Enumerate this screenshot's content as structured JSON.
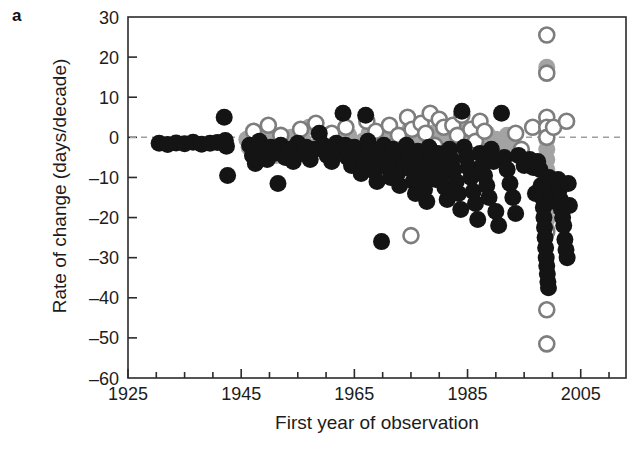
{
  "panel": {
    "label": "a"
  },
  "chart_data": {
    "type": "scatter",
    "title": "",
    "xlabel": "First year of observation",
    "ylabel": "Rate of change (days/decade)",
    "xlim": [
      1925,
      2013
    ],
    "ylim": [
      -60,
      30
    ],
    "xticks_major": [
      1925,
      1945,
      1965,
      1985,
      2005
    ],
    "xtick_labels": [
      "1925",
      "1945",
      "1965",
      "1985",
      "2005"
    ],
    "xticks_minor_step": 5,
    "yticks": [
      30,
      20,
      10,
      0,
      -10,
      -20,
      -30,
      -40,
      -50,
      -60
    ],
    "ytick_labels": [
      "30",
      "20",
      "10",
      "0",
      "-10",
      "-20",
      "-30",
      "-40",
      "-50",
      "-60"
    ],
    "grid": false,
    "legend": "none",
    "reference_line": {
      "y": 0,
      "style": "dashed",
      "color": "#9a9a9a"
    },
    "marker_radius_px": 8.5,
    "colors": {
      "filled_black": "#141414",
      "filled_gray": "#a3a3a3",
      "open_outline": "#7d7d7d",
      "open_fill": "#ffffff",
      "axis": "#2b2b2b",
      "zero_line": "#9e9e9e"
    },
    "series": [
      {
        "name": "filled-black",
        "marker": "filled-circle",
        "color": "#141414",
        "points": [
          [
            1930.5,
            -1.5
          ],
          [
            1932.0,
            -1.8
          ],
          [
            1933.5,
            -1.4
          ],
          [
            1935.0,
            -1.6
          ],
          [
            1936.5,
            -1.2
          ],
          [
            1938.0,
            -1.7
          ],
          [
            1939.5,
            -1.5
          ],
          [
            1940.8,
            -1.3
          ],
          [
            1942.0,
            5.0
          ],
          [
            1942.2,
            -0.8
          ],
          [
            1942.4,
            -2.2
          ],
          [
            1942.6,
            -9.5
          ],
          [
            1946.5,
            -2.0
          ],
          [
            1947.0,
            -4.5
          ],
          [
            1947.5,
            -6.5
          ],
          [
            1948.2,
            -1.0
          ],
          [
            1949.0,
            -3.5
          ],
          [
            1949.6,
            -5.5
          ],
          [
            1950.2,
            -2.5
          ],
          [
            1950.8,
            -4.0
          ],
          [
            1951.5,
            -11.5
          ],
          [
            1952.0,
            -2.0
          ],
          [
            1952.8,
            -5.0
          ],
          [
            1953.5,
            -3.0
          ],
          [
            1954.2,
            -6.0
          ],
          [
            1955.0,
            -1.5
          ],
          [
            1955.8,
            -4.0
          ],
          [
            1956.5,
            -2.5
          ],
          [
            1957.2,
            -5.5
          ],
          [
            1958.0,
            -3.0
          ],
          [
            1958.8,
            1.0
          ],
          [
            1959.5,
            -2.0
          ],
          [
            1960.2,
            -4.5
          ],
          [
            1961.0,
            -6.0
          ],
          [
            1961.8,
            -1.5
          ],
          [
            1962.5,
            -3.5
          ],
          [
            1963.0,
            6.0
          ],
          [
            1963.4,
            -2.0
          ],
          [
            1963.8,
            -5.0
          ],
          [
            1964.5,
            -7.0
          ],
          [
            1965.0,
            -2.5
          ],
          [
            1965.6,
            -4.0
          ],
          [
            1966.2,
            -9.0
          ],
          [
            1966.8,
            -6.5
          ],
          [
            1967.0,
            5.5
          ],
          [
            1967.4,
            -1.0
          ],
          [
            1967.8,
            -3.5
          ],
          [
            1968.2,
            -6.0
          ],
          [
            1968.6,
            -8.5
          ],
          [
            1969.0,
            -11.0
          ],
          [
            1969.4,
            -4.0
          ],
          [
            1969.8,
            -26.0
          ],
          [
            1970.2,
            -2.0
          ],
          [
            1970.6,
            -5.5
          ],
          [
            1971.0,
            -7.5
          ],
          [
            1971.4,
            -10.0
          ],
          [
            1971.8,
            -3.0
          ],
          [
            1972.2,
            -6.5
          ],
          [
            1972.6,
            -9.0
          ],
          [
            1973.0,
            -12.0
          ],
          [
            1973.4,
            -4.5
          ],
          [
            1973.8,
            -7.0
          ],
          [
            1974.2,
            -2.0
          ],
          [
            1974.6,
            -5.0
          ],
          [
            1975.0,
            -8.0
          ],
          [
            1975.4,
            -11.0
          ],
          [
            1975.8,
            -14.0
          ],
          [
            1976.2,
            -3.5
          ],
          [
            1976.6,
            -6.0
          ],
          [
            1977.0,
            -9.5
          ],
          [
            1977.4,
            -13.0
          ],
          [
            1977.8,
            -16.0
          ],
          [
            1978.2,
            -2.5
          ],
          [
            1978.6,
            -5.0
          ],
          [
            1979.0,
            -7.5
          ],
          [
            1979.4,
            -10.5
          ],
          [
            1979.8,
            -4.0
          ],
          [
            1980.2,
            -6.5
          ],
          [
            1980.6,
            -9.0
          ],
          [
            1981.0,
            -12.5
          ],
          [
            1981.4,
            -15.5
          ],
          [
            1981.8,
            -3.0
          ],
          [
            1982.2,
            -5.5
          ],
          [
            1982.6,
            -8.0
          ],
          [
            1983.0,
            -11.0
          ],
          [
            1983.4,
            -14.0
          ],
          [
            1983.8,
            -18.0
          ],
          [
            1984.0,
            6.5
          ],
          [
            1984.4,
            -2.5
          ],
          [
            1984.8,
            -5.0
          ],
          [
            1985.2,
            -7.5
          ],
          [
            1985.6,
            -10.0
          ],
          [
            1986.0,
            -13.5
          ],
          [
            1986.4,
            -16.5
          ],
          [
            1986.8,
            -20.5
          ],
          [
            1987.2,
            -4.0
          ],
          [
            1987.6,
            -7.0
          ],
          [
            1988.0,
            -9.5
          ],
          [
            1988.4,
            -12.0
          ],
          [
            1988.8,
            -15.0
          ],
          [
            1989.2,
            -3.0
          ],
          [
            1989.6,
            -6.0
          ],
          [
            1990.0,
            -18.5
          ],
          [
            1990.5,
            -22.0
          ],
          [
            1991.0,
            6.0
          ],
          [
            1991.5,
            -5.0
          ],
          [
            1992.0,
            -8.0
          ],
          [
            1992.5,
            -11.5
          ],
          [
            1993.0,
            -15.0
          ],
          [
            1993.5,
            -19.0
          ],
          [
            1994.0,
            -4.5
          ],
          [
            1995.0,
            -7.0
          ],
          [
            1996.0,
            -5.5
          ],
          [
            1996.6,
            -7.5
          ],
          [
            1997.0,
            -14.0
          ],
          [
            1997.4,
            -6.0
          ],
          [
            1997.8,
            -8.0
          ],
          [
            1998.0,
            -12.0
          ],
          [
            1998.2,
            -15.0
          ],
          [
            1998.4,
            -17.5
          ],
          [
            1998.5,
            -20.0
          ],
          [
            1998.6,
            -22.5
          ],
          [
            1998.7,
            -25.0
          ],
          [
            1998.8,
            -27.5
          ],
          [
            1998.9,
            -30.0
          ],
          [
            1999.0,
            -32.0
          ],
          [
            1999.1,
            -34.0
          ],
          [
            1999.2,
            -36.0
          ],
          [
            1999.3,
            -37.5
          ],
          [
            1999.4,
            -10.0
          ],
          [
            1999.5,
            -13.0
          ],
          [
            1999.6,
            -16.0
          ],
          [
            2001.0,
            -10.5
          ],
          [
            2001.2,
            -13.0
          ],
          [
            2001.4,
            -15.5
          ],
          [
            2001.6,
            -18.0
          ],
          [
            2001.8,
            -20.0
          ],
          [
            2002.0,
            -22.0
          ],
          [
            2002.2,
            -25.5
          ],
          [
            2002.4,
            -28.0
          ],
          [
            2002.6,
            -30.0
          ],
          [
            2002.8,
            -11.5
          ],
          [
            2003.0,
            -17.0
          ]
        ]
      },
      {
        "name": "filled-gray",
        "marker": "filled-circle",
        "color": "#a3a3a3",
        "points": [
          [
            1946.0,
            -0.5
          ],
          [
            1946.4,
            -2.5
          ],
          [
            1948.5,
            -1.0
          ],
          [
            1949.2,
            -3.0
          ],
          [
            1950.0,
            0.5
          ],
          [
            1950.6,
            -2.0
          ],
          [
            1951.2,
            -4.5
          ],
          [
            1952.5,
            -1.5
          ],
          [
            1953.8,
            0.0
          ],
          [
            1954.8,
            -3.5
          ],
          [
            1956.0,
            -1.0
          ],
          [
            1957.0,
            2.5
          ],
          [
            1958.5,
            -2.0
          ],
          [
            1960.0,
            -0.5
          ],
          [
            1961.4,
            -3.0
          ],
          [
            1962.8,
            -1.5
          ],
          [
            1964.0,
            0.5
          ],
          [
            1965.4,
            -2.5
          ],
          [
            1966.5,
            -1.0
          ],
          [
            1967.6,
            1.0
          ],
          [
            1968.4,
            -3.5
          ],
          [
            1969.2,
            -0.5
          ],
          [
            1970.0,
            -2.0
          ],
          [
            1970.8,
            1.5
          ],
          [
            1971.6,
            -1.5
          ],
          [
            1972.4,
            0.0
          ],
          [
            1973.2,
            -3.0
          ],
          [
            1974.0,
            -1.0
          ],
          [
            1974.8,
            2.0
          ],
          [
            1975.6,
            -2.5
          ],
          [
            1976.4,
            0.5
          ],
          [
            1977.2,
            -1.5
          ],
          [
            1978.0,
            -4.0
          ],
          [
            1978.8,
            1.0
          ],
          [
            1979.6,
            -0.5
          ],
          [
            1980.4,
            -2.5
          ],
          [
            1981.2,
            0.5
          ],
          [
            1982.0,
            -1.5
          ],
          [
            1982.8,
            -3.5
          ],
          [
            1983.6,
            1.5
          ],
          [
            1984.4,
            -0.5
          ],
          [
            1985.2,
            -2.0
          ],
          [
            1986.0,
            0.0
          ],
          [
            1986.8,
            -3.0
          ],
          [
            1987.6,
            -1.0
          ],
          [
            1988.4,
            1.0
          ],
          [
            1989.2,
            -2.0
          ],
          [
            1990.0,
            -0.5
          ],
          [
            1991.0,
            -2.5
          ],
          [
            1992.0,
            0.5
          ],
          [
            1993.0,
            -1.5
          ],
          [
            1999.0,
            16.5
          ],
          [
            1999.0,
            17.5
          ],
          [
            1999.0,
            1.5
          ],
          [
            1999.0,
            -0.5
          ],
          [
            1999.0,
            -3.0
          ],
          [
            1999.0,
            -5.5
          ],
          [
            1999.0,
            -8.0
          ],
          [
            1999.0,
            -10.5
          ],
          [
            1999.0,
            -13.0
          ],
          [
            1999.0,
            -15.5
          ],
          [
            1999.0,
            -18.0
          ],
          [
            1999.0,
            -20.5
          ],
          [
            1999.0,
            -23.0
          ]
        ]
      },
      {
        "name": "open-circle",
        "marker": "open-circle",
        "color": "#7d7d7d",
        "points": [
          [
            1947.2,
            1.5
          ],
          [
            1949.8,
            3.0
          ],
          [
            1952.0,
            0.5
          ],
          [
            1955.5,
            2.0
          ],
          [
            1958.2,
            3.5
          ],
          [
            1961.0,
            1.0
          ],
          [
            1963.5,
            2.5
          ],
          [
            1966.0,
            -7.5
          ],
          [
            1967.2,
            4.0
          ],
          [
            1968.8,
            1.5
          ],
          [
            1970.4,
            -6.5
          ],
          [
            1971.2,
            3.0
          ],
          [
            1972.8,
            0.5
          ],
          [
            1974.4,
            5.0
          ],
          [
            1975.2,
            2.0
          ],
          [
            1976.0,
            -4.5
          ],
          [
            1976.8,
            3.5
          ],
          [
            1977.6,
            1.0
          ],
          [
            1978.4,
            6.0
          ],
          [
            1979.2,
            -2.0
          ],
          [
            1980.0,
            4.5
          ],
          [
            1980.8,
            2.5
          ],
          [
            1981.6,
            -5.0
          ],
          [
            1982.4,
            3.0
          ],
          [
            1983.2,
            0.5
          ],
          [
            1984.0,
            5.5
          ],
          [
            1984.8,
            -7.0
          ],
          [
            1985.6,
            2.0
          ],
          [
            1986.4,
            -1.0
          ],
          [
            1987.2,
            4.0
          ],
          [
            1988.0,
            1.5
          ],
          [
            1975.0,
            -24.5
          ],
          [
            1993.5,
            1.0
          ],
          [
            1994.5,
            -3.0
          ],
          [
            1996.5,
            2.5
          ],
          [
            1999.0,
            25.5
          ],
          [
            1999.0,
            16.0
          ],
          [
            1999.0,
            5.0
          ],
          [
            1999.0,
            2.5
          ],
          [
            1999.0,
            0.0
          ],
          [
            1999.0,
            -23.5
          ],
          [
            1999.0,
            -43.0
          ],
          [
            1999.0,
            -51.5
          ],
          [
            2000.2,
            2.5
          ],
          [
            2002.5,
            4.0
          ]
        ]
      }
    ]
  }
}
